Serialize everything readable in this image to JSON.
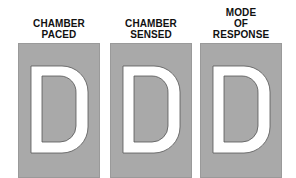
{
  "columns": [
    {
      "label_lines": [
        "CHAMBER",
        "PACED"
      ],
      "letter": "D"
    },
    {
      "label_lines": [
        "CHAMBER",
        "SENSED"
      ],
      "letter": "D"
    },
    {
      "label_lines": [
        "MODE",
        "OF",
        "RESPONSE"
      ],
      "letter": "D"
    }
  ],
  "colors": {
    "box": "#a9a9a9",
    "letter": "#ffffff",
    "outline": "#555555",
    "text": "#111111"
  }
}
